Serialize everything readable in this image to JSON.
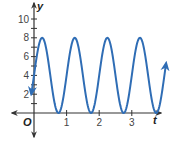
{
  "chart_data": {
    "type": "line",
    "title": "",
    "xlabel": "t",
    "ylabel": "y",
    "origin_label": "O",
    "xlim": [
      -0.7,
      4.1
    ],
    "ylim": [
      -2.5,
      11.5
    ],
    "x_ticks": [
      1,
      2,
      3
    ],
    "x_tick_labels": [
      "1",
      "2",
      "3"
    ],
    "y_ticks": [
      1,
      2,
      3,
      4,
      5,
      6,
      7,
      8,
      9,
      10
    ],
    "y_tick_labels": [
      "2",
      "4",
      "6",
      "8",
      "10"
    ],
    "y_labeled_ticks": [
      2,
      4,
      6,
      8,
      10
    ],
    "grid": false,
    "legend": null,
    "series": [
      {
        "name": "y = 4 + 4 sin(2πt)",
        "function": "4 + 4*sin(2*pi*t)",
        "domain": [
          -0.08,
          4.05
        ],
        "amplitude": 4,
        "midline": 4,
        "period": 1,
        "max": 8,
        "min": 0,
        "peaks_t": [
          0.25,
          1.25,
          2.25,
          3.25
        ],
        "minima_t": [
          0.75,
          1.75,
          2.75,
          3.75
        ],
        "color": "#2f6db5",
        "arrows_at_ends": true
      }
    ]
  },
  "colors": {
    "curve": "#2f6db5",
    "axis": "#333333",
    "background": "#ffffff"
  }
}
